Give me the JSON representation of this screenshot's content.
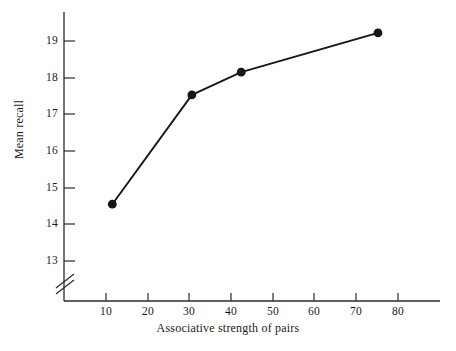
{
  "chart_data": {
    "type": "line",
    "title": "",
    "subtitle": "",
    "xlabel": "Associative strength of pairs",
    "ylabel": "Mean recall",
    "xlim": [
      0,
      88
    ],
    "ylim": [
      12.6,
      19.6
    ],
    "xticks": [
      10,
      20,
      30,
      40,
      50,
      60,
      70,
      80
    ],
    "yticks": [
      13,
      14,
      15,
      16,
      17,
      18,
      19
    ],
    "xtick_labels": [
      "10",
      "20",
      "30",
      "40",
      "50",
      "60",
      "70",
      "80"
    ],
    "ytick_labels": [
      "13",
      "14",
      "15",
      "16",
      "17",
      "18",
      "19"
    ],
    "grid": false,
    "legend": null,
    "y_axis_break": true,
    "y_axis_break_note": "double-slash break mark on y-axis below 13",
    "marker": "filled-circle",
    "line_color": "#161616",
    "marker_color": "#161616",
    "series": [
      {
        "name": "Mean recall",
        "x": [
          11.5,
          30.6,
          42.4,
          75.2
        ],
        "y": [
          14.55,
          17.53,
          18.15,
          19.22
        ]
      }
    ],
    "annotations": []
  },
  "axis": {
    "x_title": "Associative strength of pairs",
    "y_title": "Mean recall"
  },
  "colors": {
    "background": "#ffffff",
    "ink": "#1a1a1a",
    "axis": "#2b2b2b",
    "series": "#161616"
  }
}
